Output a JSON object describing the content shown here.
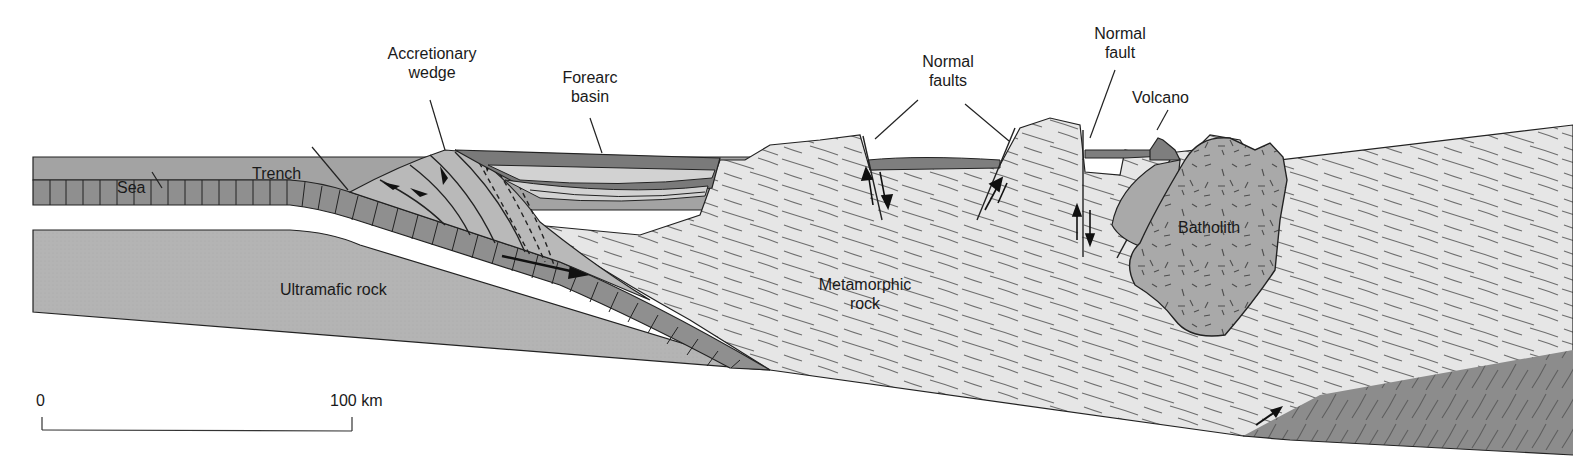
{
  "figure": {
    "type": "geologic cross-section",
    "top_cut_title": "MAGMATIC ARC",
    "colors": {
      "sea": "#a3a3a3",
      "oceanic_plate": "#8f8f8f",
      "ultramafic": "#b4b4b4",
      "metamorphic": "#e6e6e6",
      "foliation": "#6e6e6e",
      "batholith": "#a9a9a9",
      "volcano": "#7e7e7e",
      "basin_dark": "#7a7a7a",
      "basin_light": "#d2d2d2",
      "wedge": "#b9b9b9",
      "lower_right_block": "#8c8c8c",
      "outline": "#222222"
    }
  },
  "labels": {
    "sea": "Sea",
    "trench": "Trench",
    "accretionary_wedge": [
      "Accretionary",
      "wedge"
    ],
    "forearc_basin": [
      "Forearc",
      "basin"
    ],
    "normal_faults": [
      "Normal",
      "faults"
    ],
    "normal_fault": [
      "Normal",
      "fault"
    ],
    "volcano": "Volcano",
    "batholith": "Batholith",
    "ultramafic_rock": "Ultramafic rock",
    "metamorphic_rock": [
      "Metamorphic",
      "rock"
    ]
  },
  "scale_bar": {
    "start_label": "0",
    "end_label": "100 km",
    "length_km": 100
  }
}
